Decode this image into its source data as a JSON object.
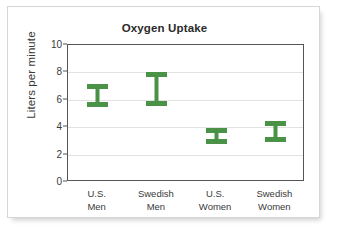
{
  "chart_data": {
    "type": "bar",
    "title": "Oxygen Uptake",
    "xlabel": "",
    "ylabel": "Liters per minute",
    "categories": [
      "U.S.\nMen",
      "Swedish\nMen",
      "U.S.\nWomen",
      "Swedish\nWomen"
    ],
    "category_lines": [
      [
        "U.S.",
        "Men"
      ],
      [
        "Swedish",
        "Men"
      ],
      [
        "U.S.",
        "Women"
      ],
      [
        "Swedish",
        "Women"
      ]
    ],
    "series": [
      {
        "name": "Oxygen uptake range",
        "low": [
          5.65,
          5.7,
          2.9,
          3.1
        ],
        "high": [
          7.0,
          7.9,
          3.8,
          4.3
        ]
      }
    ],
    "ylim": [
      0,
      10
    ],
    "yticks": [
      0,
      2,
      4,
      6,
      8,
      10
    ],
    "ytick_labels": [
      "0",
      "2",
      "4",
      "6",
      "8",
      "10"
    ],
    "grid": true,
    "legend": "none",
    "marker_style": "error-bar-i-beam",
    "colors": {
      "series": "#4a9245",
      "grid": "#e2e2e2",
      "axis": "#555555",
      "text": "#3a3a3a",
      "title": "#2b2b2b",
      "card_background": "#ffffff",
      "card_border": "#d6d6d6"
    }
  }
}
